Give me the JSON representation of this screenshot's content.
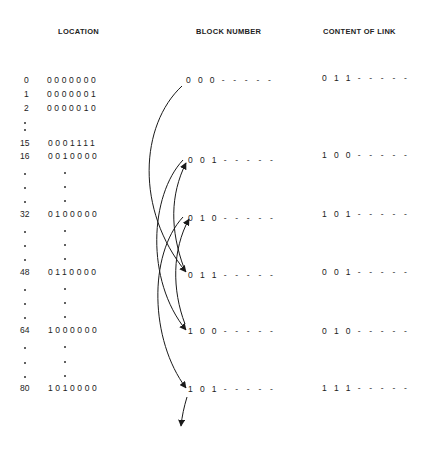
{
  "headers": {
    "location": "LOCATION",
    "block_number": "BLOCK NUMBER",
    "content_of_link": "CONTENT OF LINK"
  },
  "locations": [
    {
      "index": "0",
      "address": "0000000"
    },
    {
      "index": "1",
      "address": "0000001"
    },
    {
      "index": "2",
      "address": "0000010"
    },
    {
      "index": "15",
      "address": "0001111"
    },
    {
      "index": "16",
      "address": "0010000"
    },
    {
      "index": "32",
      "address": "0100000"
    },
    {
      "index": "48",
      "address": "0110000"
    },
    {
      "index": "64",
      "address": "1000000"
    },
    {
      "index": "80",
      "address": "1010000"
    }
  ],
  "blocks": [
    {
      "block": "000",
      "link": "011",
      "dashes": "- - - - -"
    },
    {
      "block": "001",
      "link": "100",
      "dashes": "- - - - -"
    },
    {
      "block": "010",
      "link": "101",
      "dashes": "- - - - -"
    },
    {
      "block": "011",
      "link": "001",
      "dashes": "- - - - -"
    },
    {
      "block": "100",
      "link": "010",
      "dashes": "- - - - -"
    },
    {
      "block": "101",
      "link": "111",
      "dashes": "- - - - -"
    }
  ],
  "link_chain": [
    "000",
    "011",
    "001",
    "100",
    "010",
    "101",
    "next"
  ],
  "colors": {
    "ink": "#222222",
    "background": "#ffffff"
  }
}
